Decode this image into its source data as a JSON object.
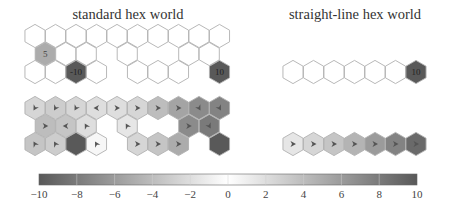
{
  "chart_data": {
    "type": "heatmap",
    "panels": [
      {
        "id": "standard-rewards",
        "title": "standard hex world",
        "kind": "reward",
        "cells": [
          {
            "row": 0,
            "col": 0,
            "value": 0
          },
          {
            "row": 0,
            "col": 1,
            "value": 0
          },
          {
            "row": 0,
            "col": 2,
            "value": 0
          },
          {
            "row": 0,
            "col": 3,
            "value": 0
          },
          {
            "row": 0,
            "col": 4,
            "value": 0
          },
          {
            "row": 0,
            "col": 5,
            "value": 0
          },
          {
            "row": 0,
            "col": 6,
            "value": 0
          },
          {
            "row": 0,
            "col": 7,
            "value": 0
          },
          {
            "row": 0,
            "col": 8,
            "value": 0
          },
          {
            "row": 0,
            "col": 9,
            "value": 0
          },
          {
            "row": 1,
            "col": 0,
            "value": 5,
            "label": "5"
          },
          {
            "row": 1,
            "col": 1,
            "value": 0
          },
          {
            "row": 1,
            "col": 2,
            "value": 0
          },
          {
            "row": 1,
            "col": 4,
            "value": 0
          },
          {
            "row": 1,
            "col": 7,
            "value": 0
          },
          {
            "row": 1,
            "col": 8,
            "value": 0
          },
          {
            "row": 2,
            "col": 0,
            "value": 0
          },
          {
            "row": 2,
            "col": 1,
            "value": 0
          },
          {
            "row": 2,
            "col": 2,
            "value": -10,
            "label": "-10"
          },
          {
            "row": 2,
            "col": 3,
            "value": 0
          },
          {
            "row": 2,
            "col": 5,
            "value": 0
          },
          {
            "row": 2,
            "col": 6,
            "value": 0
          },
          {
            "row": 2,
            "col": 7,
            "value": 0
          },
          {
            "row": 2,
            "col": 9,
            "value": 10,
            "label": "10"
          }
        ]
      },
      {
        "id": "straight-rewards",
        "title": "straight-line hex world",
        "kind": "reward",
        "cells": [
          {
            "row": 2,
            "col": 0,
            "value": 0
          },
          {
            "row": 2,
            "col": 1,
            "value": 0
          },
          {
            "row": 2,
            "col": 2,
            "value": 0
          },
          {
            "row": 2,
            "col": 3,
            "value": 0
          },
          {
            "row": 2,
            "col": 4,
            "value": 0
          },
          {
            "row": 2,
            "col": 5,
            "value": 0
          },
          {
            "row": 2,
            "col": 6,
            "value": 10,
            "label": "10"
          }
        ]
      },
      {
        "id": "standard-policy",
        "title": "",
        "kind": "policy",
        "cells": [
          {
            "row": 0,
            "col": 0,
            "value": 2.5,
            "dir": "sw"
          },
          {
            "row": 0,
            "col": 1,
            "value": 3,
            "dir": "sw"
          },
          {
            "row": 0,
            "col": 2,
            "value": 2.5,
            "dir": "sw"
          },
          {
            "row": 0,
            "col": 3,
            "value": 2,
            "dir": "w"
          },
          {
            "row": 0,
            "col": 4,
            "value": 2,
            "dir": "e"
          },
          {
            "row": 0,
            "col": 5,
            "value": 2.5,
            "dir": "e"
          },
          {
            "row": 0,
            "col": 6,
            "value": 4,
            "dir": "e"
          },
          {
            "row": 0,
            "col": 7,
            "value": 5.5,
            "dir": "e"
          },
          {
            "row": 0,
            "col": 8,
            "value": 7,
            "dir": "se"
          },
          {
            "row": 0,
            "col": 9,
            "value": 7.5,
            "dir": "se"
          },
          {
            "row": 1,
            "col": 0,
            "value": 4,
            "dir": "e"
          },
          {
            "row": 1,
            "col": 1,
            "value": 3.5,
            "dir": "w"
          },
          {
            "row": 1,
            "col": 2,
            "value": 2,
            "dir": "nw"
          },
          {
            "row": 1,
            "col": 4,
            "value": 1.5,
            "dir": "nw"
          },
          {
            "row": 1,
            "col": 7,
            "value": 7,
            "dir": "e"
          },
          {
            "row": 1,
            "col": 8,
            "value": 8,
            "dir": "se"
          },
          {
            "row": 2,
            "col": 0,
            "value": 3.5,
            "dir": "nw"
          },
          {
            "row": 2,
            "col": 1,
            "value": 3,
            "dir": "nw"
          },
          {
            "row": 2,
            "col": 2,
            "value": -10,
            "dir": ""
          },
          {
            "row": 2,
            "col": 3,
            "value": 0.5,
            "dir": "nw"
          },
          {
            "row": 2,
            "col": 5,
            "value": 2.5,
            "dir": "e"
          },
          {
            "row": 2,
            "col": 6,
            "value": 3.5,
            "dir": "e"
          },
          {
            "row": 2,
            "col": 7,
            "value": 5,
            "dir": "e"
          },
          {
            "row": 2,
            "col": 9,
            "value": 10,
            "dir": ""
          }
        ]
      },
      {
        "id": "straight-policy",
        "title": "",
        "kind": "policy",
        "cells": [
          {
            "row": 2,
            "col": 0,
            "value": 1.5,
            "dir": "e"
          },
          {
            "row": 2,
            "col": 1,
            "value": 2.5,
            "dir": "e"
          },
          {
            "row": 2,
            "col": 2,
            "value": 3.5,
            "dir": "e"
          },
          {
            "row": 2,
            "col": 3,
            "value": 4.5,
            "dir": "e"
          },
          {
            "row": 2,
            "col": 4,
            "value": 6,
            "dir": "e"
          },
          {
            "row": 2,
            "col": 5,
            "value": 7.5,
            "dir": "e"
          },
          {
            "row": 2,
            "col": 6,
            "value": 9,
            "dir": "e"
          }
        ]
      }
    ],
    "colorbar": {
      "min": -10,
      "max": 10,
      "ticks": [
        -10,
        -8,
        -6,
        -4,
        -2,
        0,
        2,
        4,
        6,
        8,
        10
      ],
      "tick_labels": [
        "−10",
        "−8",
        "−6",
        "−4",
        "−2",
        "0",
        "2",
        "4",
        "6",
        "8",
        "10"
      ],
      "colormap": "gray diverging (dark at extremes, white at 0)"
    }
  },
  "titles": {
    "left": "standard hex world",
    "right": "straight-line hex world"
  },
  "colors": {
    "hex_stroke": "#b0b0b0",
    "extreme": "#595959",
    "zero": "#ffffff",
    "arrow": "#555555",
    "text": "#333333"
  }
}
